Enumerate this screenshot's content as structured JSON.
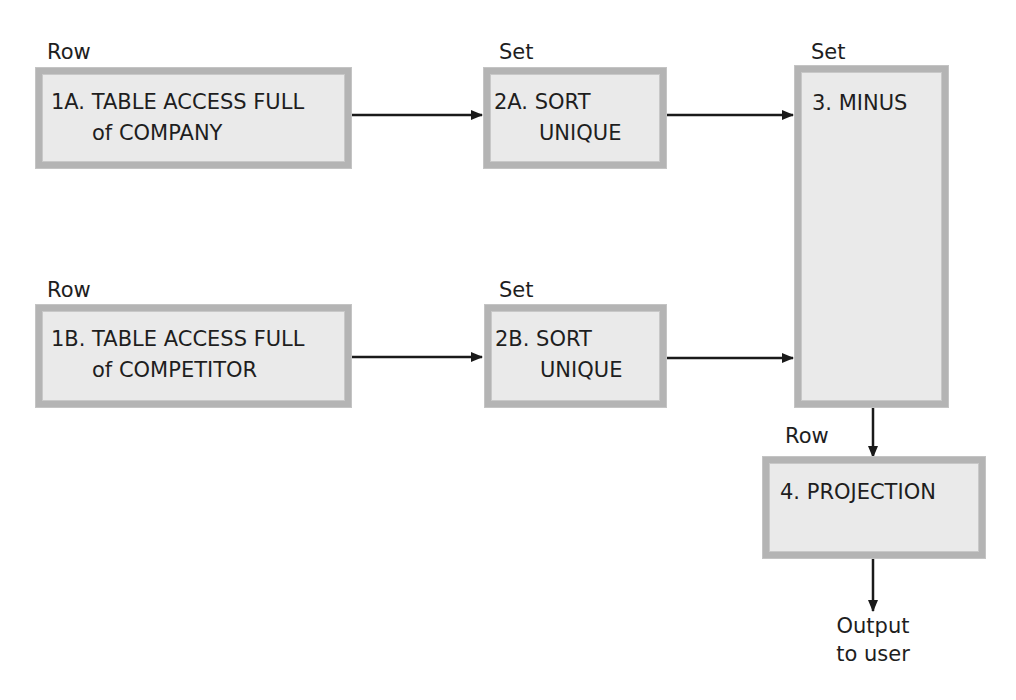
{
  "diagram": {
    "nodes": [
      {
        "id": "1A",
        "type_label": "Row",
        "line1": "1A. TABLE ACCESS FULL",
        "line2": "of COMPANY"
      },
      {
        "id": "2A",
        "type_label": "Set",
        "line1": "2A. SORT",
        "line2": "UNIQUE"
      },
      {
        "id": "3",
        "type_label": "Set",
        "line1": "3. MINUS",
        "line2": ""
      },
      {
        "id": "1B",
        "type_label": "Row",
        "line1": "1B. TABLE ACCESS FULL",
        "line2": "of COMPETITOR"
      },
      {
        "id": "2B",
        "type_label": "Set",
        "line1": "2B. SORT",
        "line2": "UNIQUE"
      },
      {
        "id": "4",
        "type_label": "Row",
        "line1": "4. PROJECTION",
        "line2": ""
      }
    ],
    "edges": [
      {
        "from": "1A",
        "to": "2A"
      },
      {
        "from": "2A",
        "to": "3"
      },
      {
        "from": "1B",
        "to": "2B"
      },
      {
        "from": "2B",
        "to": "3"
      },
      {
        "from": "3",
        "to": "4"
      },
      {
        "from": "4",
        "to": "output"
      }
    ],
    "output": {
      "line1": "Output",
      "line2": "to user"
    },
    "colors": {
      "box_fill": "#eaeaea",
      "box_border": "#b4b4b4",
      "arrow": "#1a1a1a"
    }
  }
}
